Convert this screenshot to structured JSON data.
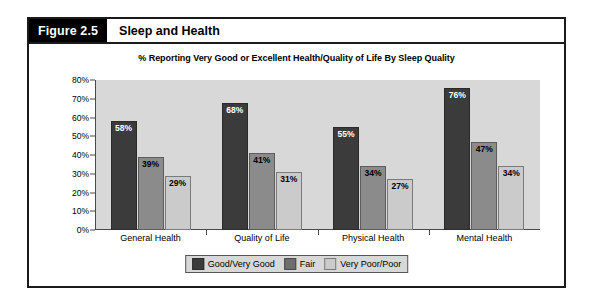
{
  "figure": {
    "number_label": "Figure 2.5",
    "title": "Sleep and Health"
  },
  "chart_data": {
    "type": "bar",
    "title": "% Reporting Very Good or Excellent Health/Quality of Life By Sleep Quality",
    "xlabel": "",
    "ylabel": "",
    "ylim": [
      0,
      80
    ],
    "grid": false,
    "legend_position": "bottom-center",
    "y_ticks": [
      "0%",
      "10%",
      "20%",
      "30%",
      "40%",
      "50%",
      "60%",
      "70%",
      "80%"
    ],
    "y_tick_values": [
      0,
      10,
      20,
      30,
      40,
      50,
      60,
      70,
      80
    ],
    "categories": [
      "General Health",
      "Quality of Life",
      "Physical Health",
      "Mental Health"
    ],
    "series": [
      {
        "name": "Good/Very Good",
        "color": "#3b3b3b",
        "values": [
          58,
          68,
          55,
          76
        ],
        "labels": [
          "58%",
          "68%",
          "55%",
          "76%"
        ]
      },
      {
        "name": "Fair",
        "color": "#8b8b8b",
        "values": [
          39,
          41,
          34,
          47
        ],
        "labels": [
          "39%",
          "41%",
          "34%",
          "47%"
        ]
      },
      {
        "name": "Very Poor/Poor",
        "color": "#cbcbcb",
        "values": [
          29,
          31,
          27,
          34
        ],
        "labels": [
          "29%",
          "31%",
          "27%",
          "34%"
        ]
      }
    ]
  }
}
